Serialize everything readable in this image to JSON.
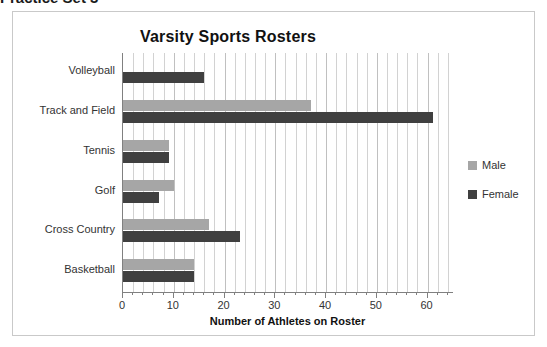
{
  "cutoff_heading": "Practice Set 3",
  "chart_data": {
    "type": "bar",
    "orientation": "horizontal",
    "title": "Varsity Sports Rosters",
    "xlabel": "Number of Athletes on Roster",
    "ylabel": "",
    "xlim": [
      0,
      65
    ],
    "xticks": [
      0,
      10,
      20,
      30,
      40,
      50,
      60
    ],
    "xtick_labels": [
      "0",
      "10",
      "20",
      "30",
      "40",
      "50",
      "60"
    ],
    "minor_tick_step": 2,
    "grid": "vertical",
    "legend_position": "right",
    "categories": [
      "Volleyball",
      "Track and Field",
      "Tennis",
      "Golf",
      "Cross Country",
      "Basketball"
    ],
    "series": [
      {
        "name": "Male",
        "color": "#a6a6a6",
        "values": [
          0,
          37,
          9,
          10,
          17,
          14
        ]
      },
      {
        "name": "Female",
        "color": "#404040",
        "values": [
          16,
          61,
          9,
          7,
          23,
          14
        ]
      }
    ]
  },
  "colors": {
    "male": "#a6a6a6",
    "female": "#404040",
    "frame": "#c9c9c9",
    "gridline": "#d2d2d2",
    "axis": "#808080",
    "text": "#333333"
  }
}
